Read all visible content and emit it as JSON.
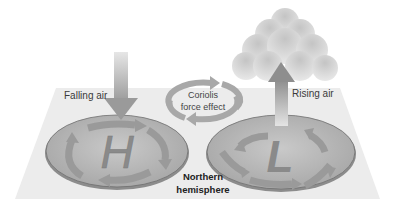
{
  "diagram": {
    "labels": {
      "falling_air": "Falling air",
      "rising_air": "Rising air",
      "coriolis_line1": "Coriolis",
      "coriolis_line2": "force effect",
      "hemisphere_line1": "Northern",
      "hemisphere_line2": "hemisphere",
      "high_symbol": "H",
      "low_symbol": "L"
    },
    "colors": {
      "plane": "#ececec",
      "disk": "#b5b5b5",
      "disk_rim": "#8a8a8a",
      "arrow": "#9a9a9a",
      "cloud": "#d8d8d8",
      "text": "#3a3a3a"
    }
  }
}
